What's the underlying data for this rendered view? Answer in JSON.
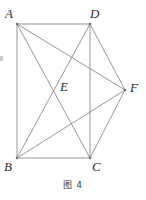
{
  "figure": {
    "caption": "图 4",
    "stroke_color": "#8a8a8a",
    "vertex_dot_color": "#6f6f6f",
    "label_color": "#2b2b2b",
    "background": "#ffffff",
    "line_width": 0.9,
    "viewbox": {
      "width": 146,
      "height": 200
    },
    "points": [
      {
        "id": "A",
        "label": "A",
        "x": 17,
        "y": 24,
        "label_x": 5,
        "label_y": 7
      },
      {
        "id": "D",
        "label": "D",
        "x": 90,
        "y": 24,
        "label_x": 90,
        "label_y": 7
      },
      {
        "id": "B",
        "label": "B",
        "x": 17,
        "y": 158,
        "label_x": 4,
        "label_y": 160
      },
      {
        "id": "C",
        "label": "C",
        "x": 90,
        "y": 158,
        "label_x": 92,
        "label_y": 160
      },
      {
        "id": "F",
        "label": "F",
        "x": 125,
        "y": 90,
        "label_x": 130,
        "label_y": 81
      },
      {
        "id": "E",
        "label": "E",
        "x": 57,
        "y": 88,
        "label_x": 60,
        "label_y": 80
      }
    ],
    "segments": [
      {
        "name": "side-AD",
        "from": "A",
        "to": "D"
      },
      {
        "name": "side-AB",
        "from": "A",
        "to": "B"
      },
      {
        "name": "side-BC",
        "from": "B",
        "to": "C"
      },
      {
        "name": "side-DC",
        "from": "D",
        "to": "C"
      },
      {
        "name": "diagonal-AC",
        "from": "A",
        "to": "C"
      },
      {
        "name": "diagonal-BD",
        "from": "B",
        "to": "D"
      },
      {
        "name": "segment-AF",
        "from": "A",
        "to": "F"
      },
      {
        "name": "segment-BF",
        "from": "B",
        "to": "F"
      },
      {
        "name": "segment-DF",
        "from": "D",
        "to": "F"
      },
      {
        "name": "segment-CF",
        "from": "C",
        "to": "F"
      }
    ]
  }
}
